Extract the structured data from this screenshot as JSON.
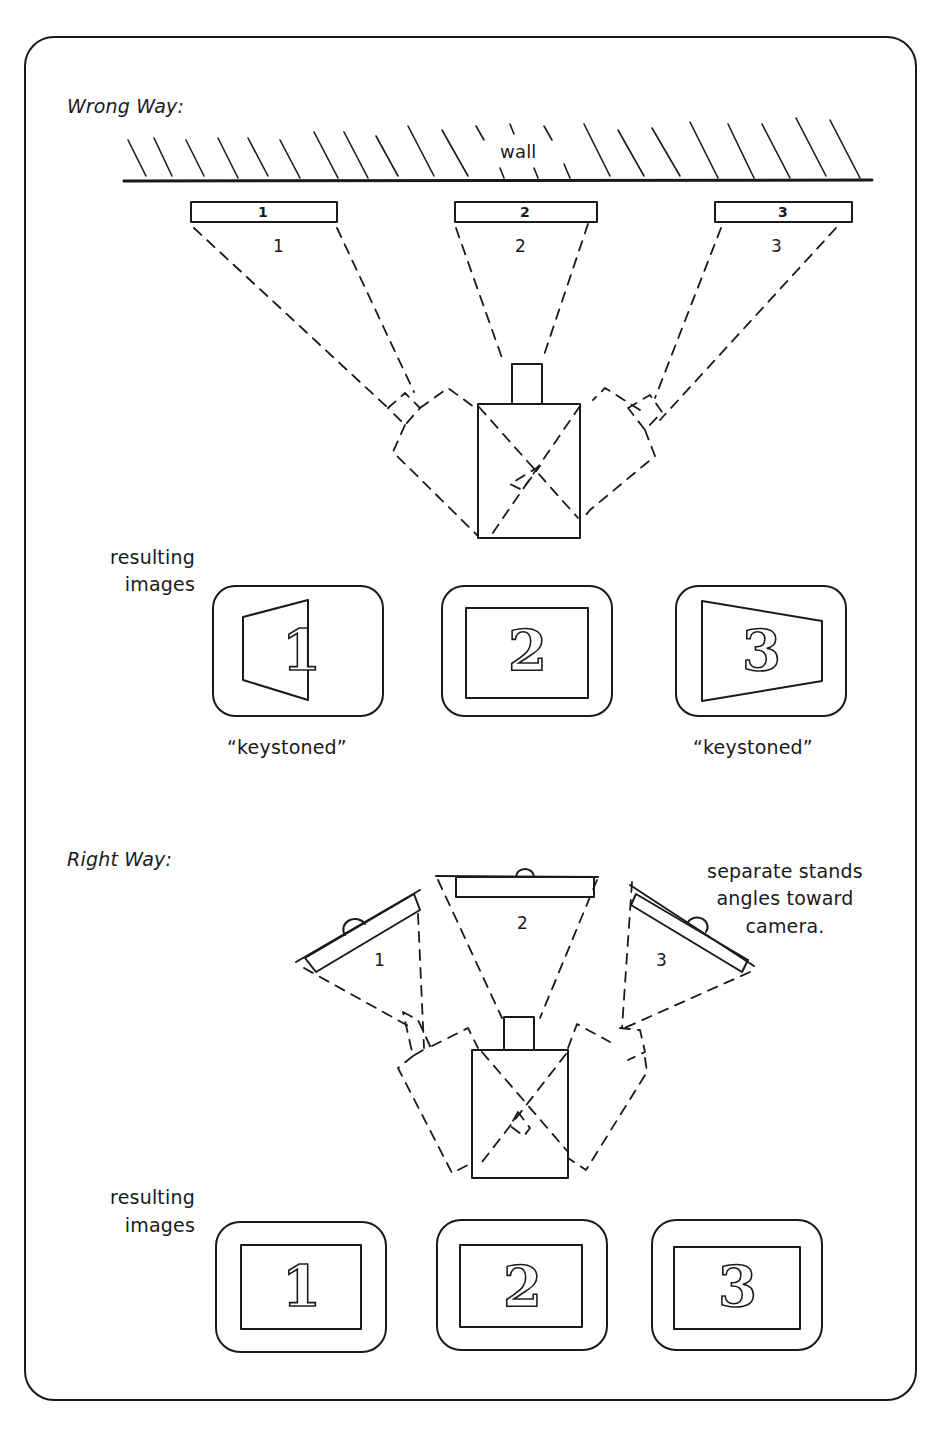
{
  "wrong_way": {
    "heading": "Wrong Way:",
    "wall_label": "wall",
    "cards": [
      {
        "face_label": "1",
        "field_label": "1"
      },
      {
        "face_label": "2",
        "field_label": "2"
      },
      {
        "face_label": "3",
        "field_label": "3"
      }
    ],
    "result_label_line1": "resulting",
    "result_label_line2": "images",
    "results": [
      {
        "digit": "1",
        "shape": "keystoned-left",
        "caption": "“keystoned”"
      },
      {
        "digit": "2",
        "shape": "rectangle",
        "caption": ""
      },
      {
        "digit": "3",
        "shape": "keystoned-right",
        "caption": "“keystoned”"
      }
    ]
  },
  "right_way": {
    "heading": "Right Way:",
    "note_line1": "separate stands",
    "note_line2": "angles toward",
    "note_line3": "camera.",
    "cards": [
      {
        "field_label": "1"
      },
      {
        "field_label": "2"
      },
      {
        "field_label": "3"
      }
    ],
    "result_label_line1": "resulting",
    "result_label_line2": "images",
    "results": [
      {
        "digit": "1",
        "shape": "rectangle"
      },
      {
        "digit": "2",
        "shape": "rectangle"
      },
      {
        "digit": "3",
        "shape": "rectangle"
      }
    ]
  },
  "colors": {
    "ink": "#1a1a1a",
    "paper": "#ffffff"
  }
}
